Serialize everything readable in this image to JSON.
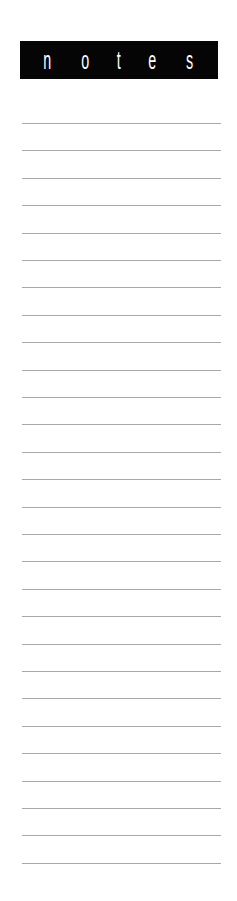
{
  "header": {
    "letters": [
      "n",
      "o",
      "t",
      "e",
      "s"
    ],
    "background": "#050505",
    "color": "#ffffff"
  },
  "lines": {
    "count": 28,
    "start_y": 123,
    "spacing": 27.4,
    "color": "#a8a8a8"
  }
}
